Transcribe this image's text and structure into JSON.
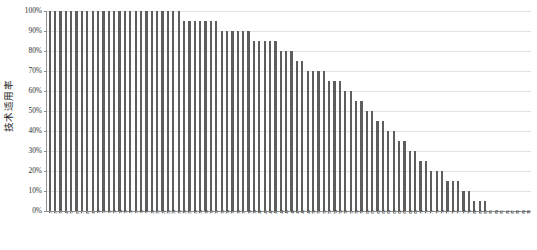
{
  "chart_data": {
    "type": "bar",
    "title": "",
    "subtitle": "",
    "xlabel": "",
    "ylabel": "技术适用率",
    "ylim": [
      0,
      100
    ],
    "y_unit": "%",
    "grid": true,
    "legend": false,
    "legend_position": "none",
    "bar_color": "#5e5e5e",
    "gridline_color": "#e2e2e2",
    "axis_color": "#8d8d8d",
    "y_ticks": [
      {
        "value": 100,
        "label": "100%"
      },
      {
        "value": 90,
        "label": "90%"
      },
      {
        "value": 80,
        "label": "80%"
      },
      {
        "value": 70,
        "label": "70%"
      },
      {
        "value": 60,
        "label": "60%"
      },
      {
        "value": 50,
        "label": "50%"
      },
      {
        "value": 40,
        "label": "40%"
      },
      {
        "value": 30,
        "label": "30%"
      },
      {
        "value": 20,
        "label": "20%"
      },
      {
        "value": 10,
        "label": "10%"
      },
      {
        "value": 0,
        "label": "0%"
      }
    ],
    "categories": [
      "1",
      "2",
      "3",
      "4",
      "5",
      "6",
      "7",
      "8",
      "9",
      "10",
      "11",
      "12",
      "13",
      "14",
      "15",
      "16",
      "17",
      "18",
      "19",
      "20",
      "21",
      "22",
      "23",
      "24",
      "25",
      "26",
      "27",
      "28",
      "29",
      "30",
      "31",
      "32",
      "33",
      "34",
      "35",
      "36",
      "37",
      "38",
      "39",
      "40",
      "41",
      "42",
      "43",
      "44",
      "45",
      "46",
      "47",
      "48",
      "49",
      "50",
      "51",
      "52",
      "53",
      "54",
      "55",
      "56",
      "57",
      "58",
      "59",
      "60",
      "61",
      "62",
      "63",
      "64",
      "65",
      "66",
      "67",
      "68",
      "69",
      "70",
      "71",
      "72",
      "73",
      "74",
      "75",
      "76",
      "77",
      "78",
      "79",
      "80",
      "81",
      "82",
      "83",
      "84",
      "85",
      "86",
      "87",
      "88",
      "89",
      "90"
    ],
    "values": [
      100,
      100,
      100,
      100,
      100,
      100,
      100,
      100,
      100,
      100,
      100,
      100,
      100,
      100,
      100,
      100,
      100,
      100,
      100,
      100,
      100,
      100,
      100,
      100,
      100,
      95,
      95,
      95,
      95,
      95,
      95,
      95,
      90,
      90,
      90,
      90,
      90,
      90,
      85,
      85,
      85,
      85,
      85,
      80,
      80,
      80,
      75,
      75,
      70,
      70,
      70,
      70,
      65,
      65,
      65,
      60,
      60,
      55,
      55,
      50,
      50,
      45,
      45,
      40,
      40,
      35,
      35,
      30,
      30,
      25,
      25,
      20,
      20,
      20,
      15,
      15,
      15,
      10,
      10,
      5,
      5,
      5,
      0,
      0,
      0,
      0,
      0,
      0,
      0,
      0
    ]
  }
}
